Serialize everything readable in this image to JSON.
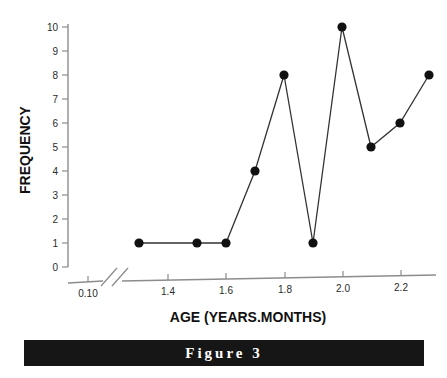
{
  "figure": {
    "caption": "Figure 3",
    "caption_bar_color": "#161616",
    "caption_text_color": "#ffffff"
  },
  "chart_data": {
    "type": "line",
    "title": "",
    "xlabel": "AGE (YEARS.MONTHS)",
    "ylabel": "FREQUENCY",
    "x": [
      1.3,
      1.5,
      1.6,
      1.7,
      1.8,
      1.9,
      2.0,
      2.1,
      2.2,
      2.3
    ],
    "values": [
      1,
      1,
      1,
      4,
      8,
      1,
      10,
      5,
      6,
      8
    ],
    "series": [
      {
        "name": "Frequency",
        "values": [
          1,
          1,
          1,
          4,
          8,
          1,
          10,
          5,
          6,
          8
        ]
      }
    ],
    "xlim": [
      1.25,
      2.35
    ],
    "ylim": [
      0,
      10
    ],
    "xticks": [
      1.4,
      1.6,
      1.8,
      2.0,
      2.2
    ],
    "xtick_labels": [
      "1.4",
      "1.6",
      "1.8",
      "2.0",
      "2.2"
    ],
    "yticks": [
      0,
      1,
      2,
      3,
      4,
      5,
      6,
      7,
      8,
      9,
      10
    ],
    "ytick_labels": [
      "0",
      "1",
      "2",
      "3",
      "4",
      "5",
      "6",
      "7",
      "8",
      "9",
      "10"
    ],
    "axis_break": {
      "present": true,
      "origin_label": "0.10"
    },
    "grid": false,
    "legend": "none",
    "marker": "filled-circle",
    "marker_color": "#111111",
    "line_color": "#333333",
    "axis_color": "#8c8c8c"
  }
}
